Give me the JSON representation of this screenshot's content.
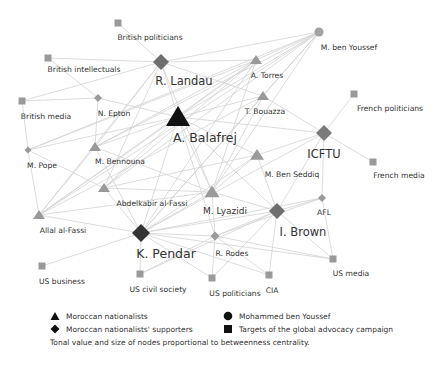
{
  "diagram": {
    "nodes": [
      {
        "id": "british_politicians",
        "label": "British politicians",
        "shape": "square",
        "x": 118,
        "y": 23,
        "size": 7,
        "color": "#9a9a9a",
        "lx": 150,
        "ly": 40,
        "fs": "s"
      },
      {
        "id": "british_intellectuals",
        "label": "British intellectuals",
        "shape": "square",
        "x": 48,
        "y": 58,
        "size": 7,
        "color": "#9a9a9a",
        "lx": 84,
        "ly": 72,
        "fs": "s"
      },
      {
        "id": "r_landau",
        "label": "R. Landau",
        "shape": "diamond",
        "x": 161,
        "y": 62,
        "size": 16,
        "color": "#6e6e6e",
        "lx": 184,
        "ly": 85,
        "fs": "l"
      },
      {
        "id": "british_media",
        "label": "British media",
        "shape": "square",
        "x": 22,
        "y": 101,
        "size": 7,
        "color": "#9a9a9a",
        "lx": 46,
        "ly": 119,
        "fs": "s"
      },
      {
        "id": "n_epton",
        "label": "N. Epton",
        "shape": "diamond",
        "x": 98,
        "y": 98,
        "size": 8,
        "color": "#9a9a9a",
        "lx": 114,
        "ly": 116,
        "fs": "s"
      },
      {
        "id": "a_balafrej",
        "label": "A. Balafrej",
        "shape": "triangle",
        "x": 178,
        "y": 117,
        "size": 22,
        "color": "#111111",
        "lx": 205,
        "ly": 142,
        "fs": "xl"
      },
      {
        "id": "m_ben_youssef",
        "label": "M. ben Youssef",
        "shape": "circle",
        "x": 319,
        "y": 32,
        "size": 9,
        "color": "#a3a3a3",
        "lx": 349,
        "ly": 50,
        "fs": "s"
      },
      {
        "id": "a_torres",
        "label": "A. Torres",
        "shape": "triangle",
        "x": 256,
        "y": 60,
        "size": 10,
        "color": "#9a9a9a",
        "lx": 267,
        "ly": 78,
        "fs": "s"
      },
      {
        "id": "t_bouazza",
        "label": "T. Bouazza",
        "shape": "triangle",
        "x": 263,
        "y": 96,
        "size": 10,
        "color": "#9a9a9a",
        "lx": 265,
        "ly": 114,
        "fs": "s"
      },
      {
        "id": "french_politicians",
        "label": "French politicians",
        "shape": "square",
        "x": 354,
        "y": 94,
        "size": 7,
        "color": "#9a9a9a",
        "lx": 390,
        "ly": 111,
        "fs": "s"
      },
      {
        "id": "icftu",
        "label": "ICFTU",
        "shape": "diamond",
        "x": 324,
        "y": 133,
        "size": 16,
        "color": "#7a7a7a",
        "lx": 324,
        "ly": 158,
        "fs": "l"
      },
      {
        "id": "french_media",
        "label": "French media",
        "shape": "square",
        "x": 373,
        "y": 162,
        "size": 7,
        "color": "#9a9a9a",
        "lx": 399,
        "ly": 178,
        "fs": "s"
      },
      {
        "id": "m_pope",
        "label": "M. Pope",
        "shape": "diamond",
        "x": 28,
        "y": 150,
        "size": 7,
        "color": "#9a9a9a",
        "lx": 42,
        "ly": 168,
        "fs": "s"
      },
      {
        "id": "m_bennouna",
        "label": "M. Bennouna",
        "shape": "triangle",
        "x": 95,
        "y": 147,
        "size": 10,
        "color": "#9a9a9a",
        "lx": 120,
        "ly": 164,
        "fs": "s"
      },
      {
        "id": "m_ben_seddiq",
        "label": "M. Ben Seddiq",
        "shape": "triangle",
        "x": 257,
        "y": 155,
        "size": 12,
        "color": "#9a9a9a",
        "lx": 292,
        "ly": 177,
        "fs": "s"
      },
      {
        "id": "abdelkabir_al_fassi",
        "label": "Abdelkabir al-Fassi",
        "shape": "triangle",
        "x": 104,
        "y": 188,
        "size": 10,
        "color": "#9a9a9a",
        "lx": 152,
        "ly": 206,
        "fs": "s"
      },
      {
        "id": "m_lyazidi",
        "label": "M. Lyazidi",
        "shape": "triangle",
        "x": 212,
        "y": 192,
        "size": 13,
        "color": "#9a9a9a",
        "lx": 225,
        "ly": 214,
        "fs": "m"
      },
      {
        "id": "allal_al_fassi",
        "label": "Allal al-Fassi",
        "shape": "triangle",
        "x": 39,
        "y": 215,
        "size": 10,
        "color": "#9a9a9a",
        "lx": 63,
        "ly": 233,
        "fs": "s"
      },
      {
        "id": "afl",
        "label": "AFL",
        "shape": "diamond",
        "x": 322,
        "y": 198,
        "size": 8,
        "color": "#9a9a9a",
        "lx": 324,
        "ly": 215,
        "fs": "s"
      },
      {
        "id": "i_brown",
        "label": "I. Brown",
        "shape": "diamond",
        "x": 277,
        "y": 211,
        "size": 16,
        "color": "#6e6e6e",
        "lx": 303,
        "ly": 236,
        "fs": "l"
      },
      {
        "id": "k_pendar",
        "label": "K. Pendar",
        "shape": "diamond",
        "x": 141,
        "y": 233,
        "size": 18,
        "color": "#333333",
        "lx": 166,
        "ly": 258,
        "fs": "xl"
      },
      {
        "id": "r_rodes",
        "label": "R. Rodes",
        "shape": "diamond",
        "x": 215,
        "y": 236,
        "size": 9,
        "color": "#9a9a9a",
        "lx": 232,
        "ly": 256,
        "fs": "s"
      },
      {
        "id": "us_business",
        "label": "US business",
        "shape": "square",
        "x": 42,
        "y": 266,
        "size": 7,
        "color": "#9a9a9a",
        "lx": 62,
        "ly": 284,
        "fs": "s"
      },
      {
        "id": "us_civil_society",
        "label": "US civil society",
        "shape": "square",
        "x": 140,
        "y": 274,
        "size": 7,
        "color": "#9a9a9a",
        "lx": 158,
        "ly": 292,
        "fs": "s"
      },
      {
        "id": "us_politicians",
        "label": "US politicians",
        "shape": "square",
        "x": 212,
        "y": 278,
        "size": 7,
        "color": "#9a9a9a",
        "lx": 235,
        "ly": 296,
        "fs": "s"
      },
      {
        "id": "cia",
        "label": "CIA",
        "shape": "square",
        "x": 269,
        "y": 275,
        "size": 7,
        "color": "#9a9a9a",
        "lx": 272,
        "ly": 293,
        "fs": "s"
      },
      {
        "id": "us_media",
        "label": "US media",
        "shape": "square",
        "x": 333,
        "y": 259,
        "size": 7,
        "color": "#9a9a9a",
        "lx": 351,
        "ly": 276,
        "fs": "s"
      }
    ],
    "edges": [
      [
        "british_politicians",
        "r_landau"
      ],
      [
        "british_intellectuals",
        "r_landau"
      ],
      [
        "british_intellectuals",
        "n_epton"
      ],
      [
        "british_media",
        "r_landau"
      ],
      [
        "british_media",
        "n_epton"
      ],
      [
        "british_media",
        "m_pope"
      ],
      [
        "n_epton",
        "a_balafrej"
      ],
      [
        "n_epton",
        "m_bennouna"
      ],
      [
        "r_landau",
        "a_torres"
      ],
      [
        "r_landau",
        "m_ben_youssef"
      ],
      [
        "r_landau",
        "a_balafrej"
      ],
      [
        "r_landau",
        "m_lyazidi"
      ],
      [
        "r_landau",
        "allal_al_fassi"
      ],
      [
        "r_landau",
        "abdelkabir_al_fassi"
      ],
      [
        "r_landau",
        "m_bennouna"
      ],
      [
        "r_landau",
        "t_bouazza"
      ],
      [
        "m_ben_youssef",
        "a_torres"
      ],
      [
        "m_ben_youssef",
        "a_balafrej"
      ],
      [
        "m_ben_youssef",
        "m_lyazidi"
      ],
      [
        "m_ben_youssef",
        "m_bennouna"
      ],
      [
        "m_ben_youssef",
        "abdelkabir_al_fassi"
      ],
      [
        "m_ben_youssef",
        "allal_al_fassi"
      ],
      [
        "m_ben_youssef",
        "k_pendar"
      ],
      [
        "m_ben_youssef",
        "m_pope"
      ],
      [
        "m_ben_youssef",
        "t_bouazza"
      ],
      [
        "a_torres",
        "a_balafrej"
      ],
      [
        "a_torres",
        "m_bennouna"
      ],
      [
        "a_torres",
        "allal_al_fassi"
      ],
      [
        "a_torres",
        "m_lyazidi"
      ],
      [
        "a_torres",
        "abdelkabir_al_fassi"
      ],
      [
        "a_torres",
        "k_pendar"
      ],
      [
        "a_torres",
        "m_pope"
      ],
      [
        "t_bouazza",
        "icftu"
      ],
      [
        "t_bouazza",
        "m_lyazidi"
      ],
      [
        "t_bouazza",
        "a_balafrej"
      ],
      [
        "t_bouazza",
        "allal_al_fassi"
      ],
      [
        "t_bouazza",
        "k_pendar"
      ],
      [
        "french_politicians",
        "icftu"
      ],
      [
        "icftu",
        "french_media"
      ],
      [
        "icftu",
        "afl"
      ],
      [
        "icftu",
        "m_ben_seddiq"
      ],
      [
        "icftu",
        "i_brown"
      ],
      [
        "icftu",
        "a_balafrej"
      ],
      [
        "icftu",
        "k_pendar"
      ],
      [
        "a_balafrej",
        "m_ben_seddiq"
      ],
      [
        "a_balafrej",
        "m_lyazidi"
      ],
      [
        "a_balafrej",
        "i_brown"
      ],
      [
        "a_balafrej",
        "k_pendar"
      ],
      [
        "a_balafrej",
        "abdelkabir_al_fassi"
      ],
      [
        "a_balafrej",
        "allal_al_fassi"
      ],
      [
        "a_balafrej",
        "m_bennouna"
      ],
      [
        "a_balafrej",
        "m_pope"
      ],
      [
        "a_balafrej",
        "r_rodes"
      ],
      [
        "m_pope",
        "allal_al_fassi"
      ],
      [
        "m_pope",
        "abdelkabir_al_fassi"
      ],
      [
        "m_bennouna",
        "allal_al_fassi"
      ],
      [
        "m_bennouna",
        "k_pendar"
      ],
      [
        "m_bennouna",
        "m_lyazidi"
      ],
      [
        "abdelkabir_al_fassi",
        "k_pendar"
      ],
      [
        "abdelkabir_al_fassi",
        "m_lyazidi"
      ],
      [
        "abdelkabir_al_fassi",
        "m_ben_seddiq"
      ],
      [
        "allal_al_fassi",
        "m_lyazidi"
      ],
      [
        "allal_al_fassi",
        "k_pendar"
      ],
      [
        "m_ben_seddiq",
        "i_brown"
      ],
      [
        "m_ben_seddiq",
        "k_pendar"
      ],
      [
        "m_ben_seddiq",
        "m_lyazidi"
      ],
      [
        "m_lyazidi",
        "i_brown"
      ],
      [
        "m_lyazidi",
        "k_pendar"
      ],
      [
        "m_lyazidi",
        "r_rodes"
      ],
      [
        "afl",
        "i_brown"
      ],
      [
        "afl",
        "us_media"
      ],
      [
        "afl",
        "k_pendar"
      ],
      [
        "afl",
        "r_rodes"
      ],
      [
        "i_brown",
        "us_media"
      ],
      [
        "i_brown",
        "cia"
      ],
      [
        "i_brown",
        "us_politicians"
      ],
      [
        "i_brown",
        "k_pendar"
      ],
      [
        "i_brown",
        "r_rodes"
      ],
      [
        "i_brown",
        "us_civil_society"
      ],
      [
        "k_pendar",
        "us_business"
      ],
      [
        "k_pendar",
        "us_civil_society"
      ],
      [
        "k_pendar",
        "r_rodes"
      ],
      [
        "k_pendar",
        "cia"
      ],
      [
        "k_pendar",
        "us_media"
      ],
      [
        "k_pendar",
        "us_politicians"
      ],
      [
        "r_rodes",
        "us_politicians"
      ],
      [
        "r_rodes",
        "us_civil_society"
      ],
      [
        "r_rodes",
        "us_media"
      ],
      [
        "r_rodes",
        "cia"
      ]
    ]
  },
  "legend": {
    "items": [
      {
        "shape": "triangle",
        "label": "Moroccan nationalists"
      },
      {
        "shape": "circle",
        "label": "Mohammed ben Youssef"
      },
      {
        "shape": "diamond",
        "label": "Moroccan nationalists' supporters"
      },
      {
        "shape": "square",
        "label": "Targets of the global advocacy campaign"
      }
    ],
    "note": "Tonal value and size of nodes proportional to betweenness centrality."
  }
}
